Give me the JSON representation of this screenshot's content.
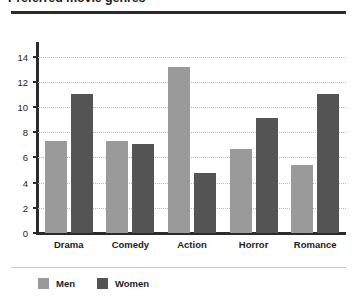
{
  "chart_data": {
    "type": "bar",
    "title": "Preferred movie genres",
    "xlabel": "",
    "ylabel": "",
    "ylim": [
      0,
      15
    ],
    "yticks": [
      0,
      2,
      4,
      6,
      8,
      10,
      12,
      14
    ],
    "grid": true,
    "legend_position": "bottom-left",
    "categories": [
      "Drama",
      "Comedy",
      "Action",
      "Horror",
      "Romance"
    ],
    "series": [
      {
        "name": "Men",
        "color": "#9a9a9a",
        "values": [
          7.3,
          7.3,
          13.2,
          6.7,
          5.4
        ]
      },
      {
        "name": "Women",
        "color": "#545454",
        "values": [
          11.0,
          7.1,
          4.8,
          9.1,
          11.0
        ]
      }
    ]
  },
  "colors": {
    "men": "#9a9a9a",
    "women": "#545454",
    "axis": "#2b2b2b",
    "grid": "#b9b9b9",
    "text": "#1c1c1c",
    "background": "#ffffff"
  }
}
